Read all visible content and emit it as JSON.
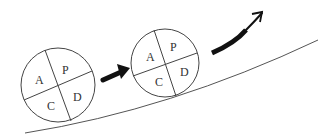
{
  "diagram": {
    "type": "PDCA cycle ball rolling up a slope",
    "colors": {
      "line": "#444444",
      "slope": "#555555",
      "arrow": "#111111",
      "background": "#ffffff"
    },
    "wheels": [
      {
        "id": "wheel-1",
        "quadrants": {
          "top_left": "A",
          "top_right": "P",
          "bottom_left": "C",
          "bottom_right": "D"
        }
      },
      {
        "id": "wheel-2",
        "quadrants": {
          "top_left": "A",
          "top_right": "P",
          "bottom_left": "C",
          "bottom_right": "D"
        }
      }
    ],
    "arrows": [
      {
        "id": "arrow-between-wheels",
        "direction": "up-right"
      },
      {
        "id": "arrow-upward-curve",
        "direction": "up-right"
      }
    ],
    "slope": {
      "id": "incline-line",
      "direction": "rising left-to-right"
    }
  }
}
